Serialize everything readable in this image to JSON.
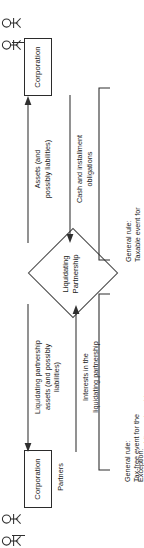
{
  "diagram": {
    "title": "Liquidating Partnership",
    "type": "flowchart",
    "orientation": "rotated-90-counterclockwise",
    "center_node": {
      "shape": "diamond",
      "line1": "Liquidating",
      "line2": "Partnership"
    },
    "top_branch": {
      "entity_label": "Corporation",
      "actors_label": "",
      "flow_out_label": "Assets (and\npossibly liabilities)",
      "flow_in_label": "Cash and installment\nobligations",
      "bracket_note_prefix": "General rule:",
      "bracket_note_body": "Taxable event for\nthe selling partnership"
    },
    "bottom_branch": {
      "entity_label": "Corporation",
      "actors_label": "Partners",
      "flow_out_label": "Liquidating partnership\nassets (and possibly\nliabilities)",
      "flow_in_label": "Interests in the\nliquidating partnership",
      "bracket_note_line1_prefix": "General rule:",
      "bracket_note_line1_body": "Tax-free event for the\npartners and the partnership",
      "bracket_note_line2_prefix": "Exception:",
      "bracket_note_line2_body": "Special rules permit gain\nor loss to be recognized"
    },
    "colors": {
      "stroke": "#2f2f2f",
      "text": "#1a1a1a",
      "background": "#ffffff"
    }
  }
}
